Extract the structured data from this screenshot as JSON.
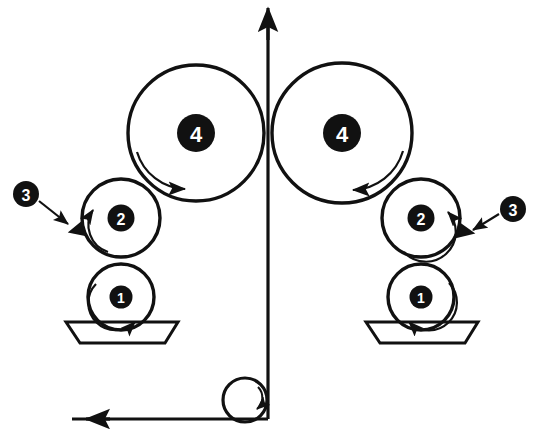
{
  "figure": {
    "type": "mechanical-schematic",
    "stroke_color": "#111111",
    "badge_fill": "#111111",
    "badge_text_color": "#ffffff",
    "background_color": "#ffffff",
    "width": 533,
    "height": 438
  },
  "labels": {
    "roller_1": "1",
    "roller_2": "2",
    "blade_3": "3",
    "roller_4": "4"
  },
  "components": {
    "left_applicator_roller": {
      "label": "1",
      "cx": 121,
      "cy": 297,
      "r": 33,
      "rotation": "clockwise"
    },
    "left_metering_roller": {
      "label": "2",
      "cx": 121,
      "cy": 218,
      "r": 39,
      "rotation": "counter-clockwise"
    },
    "left_main_roller": {
      "label": "4",
      "cx": 196,
      "cy": 133,
      "r": 68,
      "rotation": "clockwise"
    },
    "right_applicator_roller": {
      "label": "1",
      "cx": 421,
      "cy": 297,
      "r": 33,
      "rotation": "clockwise"
    },
    "right_metering_roller": {
      "label": "2",
      "cx": 421,
      "cy": 218,
      "r": 39,
      "rotation": "clockwise"
    },
    "right_main_roller": {
      "label": "4",
      "cx": 342,
      "cy": 133,
      "r": 70,
      "rotation": "counter-clockwise"
    },
    "turning_roller": {
      "label": "",
      "cx": 245,
      "cy": 400,
      "r": 22,
      "rotation": "clockwise"
    },
    "left_coating_pan": {
      "top_left_x": 66,
      "top_right_x": 178,
      "bottom_left_x": 80,
      "bottom_right_x": 165,
      "top_y": 322,
      "bottom_y": 343
    },
    "right_coating_pan": {
      "top_left_x": 366,
      "top_right_x": 478,
      "bottom_left_x": 380,
      "bottom_right_x": 465,
      "top_y": 322,
      "bottom_y": 343
    },
    "left_doctor_blade": {
      "label": "3",
      "badge_cx": 26,
      "badge_cy": 194,
      "tip_x": 72,
      "tip_y": 228
    },
    "right_doctor_blade": {
      "label": "3",
      "badge_cx": 513,
      "badge_cy": 209,
      "tip_x": 470,
      "tip_y": 231
    },
    "web_path": {
      "horizontal_y": 419,
      "horizontal_start_x": 72,
      "horizontal_end_x": 268,
      "vertical_x": 268,
      "vertical_top_y": 10,
      "direction_top": "up",
      "direction_horizontal": "right"
    }
  }
}
